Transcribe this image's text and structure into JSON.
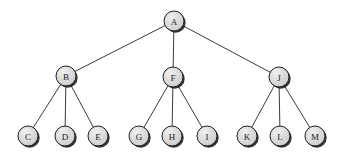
{
  "diagram": {
    "type": "rooted-tree",
    "background_color": "#ffffff",
    "node_fill_color": "#d9d9d9",
    "node_highlight_color": "#f2f2f2",
    "node_stroke_color": "#1f1f1f",
    "node_shadow_color": "#1a1a1a",
    "edge_color": "#3c3c3c",
    "node_radius": 10,
    "nodes": [
      {
        "id": "A",
        "label": "A",
        "x": 174,
        "y": 21,
        "level": 0
      },
      {
        "id": "B",
        "label": "B",
        "x": 66,
        "y": 76,
        "level": 1
      },
      {
        "id": "F",
        "label": "F",
        "x": 173,
        "y": 77,
        "level": 1
      },
      {
        "id": "J",
        "label": "J",
        "x": 279,
        "y": 77,
        "level": 1
      },
      {
        "id": "C",
        "label": "C",
        "x": 28,
        "y": 136,
        "level": 2
      },
      {
        "id": "D",
        "label": "D",
        "x": 65,
        "y": 136,
        "level": 2
      },
      {
        "id": "E",
        "label": "E",
        "x": 98,
        "y": 136,
        "level": 2
      },
      {
        "id": "G",
        "label": "G",
        "x": 139,
        "y": 136,
        "level": 2
      },
      {
        "id": "H",
        "label": "H",
        "x": 172,
        "y": 136,
        "level": 2
      },
      {
        "id": "I",
        "label": "I",
        "x": 207,
        "y": 136,
        "level": 2
      },
      {
        "id": "K",
        "label": "K",
        "x": 247,
        "y": 136,
        "level": 2
      },
      {
        "id": "L",
        "label": "L",
        "x": 280,
        "y": 136,
        "level": 2
      },
      {
        "id": "M",
        "label": "M",
        "x": 315,
        "y": 136,
        "level": 2
      }
    ],
    "edges": [
      {
        "from": "A",
        "to": "B"
      },
      {
        "from": "A",
        "to": "F"
      },
      {
        "from": "A",
        "to": "J"
      },
      {
        "from": "B",
        "to": "C"
      },
      {
        "from": "B",
        "to": "D"
      },
      {
        "from": "B",
        "to": "E"
      },
      {
        "from": "F",
        "to": "G"
      },
      {
        "from": "F",
        "to": "H"
      },
      {
        "from": "F",
        "to": "I"
      },
      {
        "from": "J",
        "to": "K"
      },
      {
        "from": "J",
        "to": "L"
      },
      {
        "from": "J",
        "to": "M"
      }
    ]
  }
}
